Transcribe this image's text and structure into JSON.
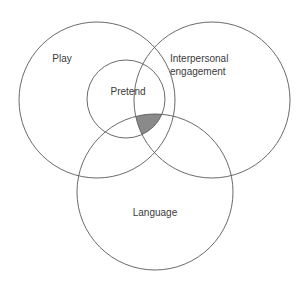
{
  "figure": {
    "type": "venn-diagram",
    "background_color": "#ffffff",
    "stroke_color": "#595959",
    "label_color": "#3a3a3a",
    "shaded_region_color": "#8a8a8a"
  },
  "circles": [
    {
      "id": "play",
      "label": "Play",
      "cx": 97,
      "cy": 100,
      "r": 78,
      "label_x": 62,
      "label_y": 59
    },
    {
      "id": "interpersonal-engagement",
      "label": "Interpersonal engagement",
      "label_line_1": "Interpersonal",
      "label_line_2": "engagement",
      "cx": 212,
      "cy": 100,
      "r": 78,
      "label_x": 170,
      "label_y": 62
    },
    {
      "id": "language",
      "label": "Language",
      "cx": 155,
      "cy": 192,
      "r": 78,
      "label_x": 155,
      "label_y": 213
    }
  ],
  "inner_circle": {
    "id": "pretend",
    "label": "Pretend",
    "cx": 126,
    "cy": 99,
    "r": 39,
    "label_x": 128,
    "label_y": 92
  },
  "shaded_region": {
    "id": "triple-overlap",
    "description": "Pretend and Interpersonal engagement and Language overlap",
    "color": "#8a8a8a"
  }
}
